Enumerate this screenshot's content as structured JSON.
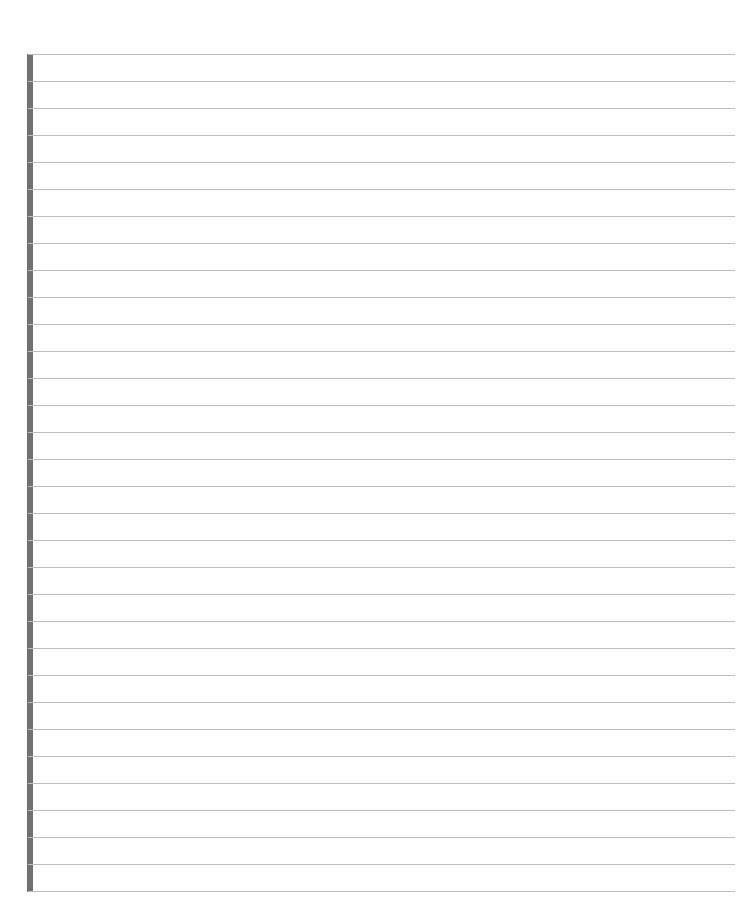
{
  "page": {
    "type": "lined-paper",
    "background": "#ffffff",
    "rule_color": "#bfbfbf",
    "margin_bar_color": "#707070",
    "first_rule_y": 54,
    "rule_spacing": 27,
    "rule_count": 32,
    "margin_bar": {
      "x": 27,
      "width": 6,
      "top": 54,
      "bottom": 892
    }
  }
}
